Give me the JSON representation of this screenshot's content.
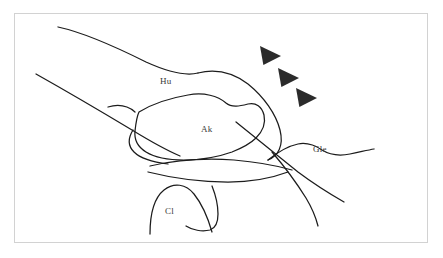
{
  "figure": {
    "kind": "anatomical-line-drawing",
    "background_color": "#ffffff",
    "frame_color": "#d2d2d2",
    "stroke_color": "#1c1c1c",
    "marker_color": "#2b2b2b"
  },
  "labels": {
    "humerus": "Hu",
    "acromion": "Ak",
    "glenoid": "Gle",
    "clavicle": "Cl"
  },
  "markers": {
    "name": "arrowhead",
    "count": 3,
    "direction": "right",
    "items": [
      {
        "id": "arrowhead-1",
        "x": 260,
        "y": 46
      },
      {
        "id": "arrowhead-2",
        "x": 278,
        "y": 68
      },
      {
        "id": "arrowhead-3",
        "x": 296,
        "y": 88
      }
    ]
  },
  "contours": {
    "humeral_shaft_superior": "M 58,27 C 86,33 118,48 146,62 C 168,72 186,76 198,73",
    "humeral_head_arc": "M 198,73 C 214,69 232,72 248,84 C 264,97 276,114 280,130 C 284,146 278,156 268,160",
    "humeral_shaft_inferior": "M 36,74 C 68,92 102,112 132,130 C 150,141 166,150 180,156",
    "acromion_outline": "M 139,112 C 152,104 170,98 188,95 C 204,92 218,96 226,103 C 232,108 240,106 248,104 C 256,102 262,107 264,115 C 266,124 262,132 256,138 C 250,144 242,148 232,152 C 218,157 200,160 184,160 C 168,160 154,157 146,152 C 138,147 134,140 135,131 C 136,122 137,116 139,112 Z",
    "acromion_spine": "M 108,107 C 118,104 128,106 135,112",
    "subacromial_lower": "M 133,130 C 128,138 128,146 134,152 C 140,158 152,162 168,164",
    "glenoid_surface": "M 268,160 C 278,152 288,146 298,144 C 308,142 316,146 322,150 C 330,155 340,156 350,154 C 360,152 368,150 374,149",
    "joint_line_upper": "M 150,166 C 176,160 206,158 234,160 C 258,162 278,166 292,170",
    "joint_line_lower": "M 148,172 C 172,178 200,182 228,182 C 252,182 272,178 288,172",
    "scapula_diagonal": "M 236,122 C 256,138 278,156 298,172 C 314,184 330,194 344,202",
    "lateral_border": "M 272,152 C 284,166 296,182 306,198 C 312,208 316,218 318,226",
    "clavicle_arch": "M 150,234 C 150,214 154,198 164,190 C 174,182 186,184 194,194 C 202,204 208,218 212,232",
    "clavicle_inferior": "M 212,186 C 216,196 218,206 218,214 C 218,222 216,228 210,230 C 202,232 192,230 186,226"
  }
}
